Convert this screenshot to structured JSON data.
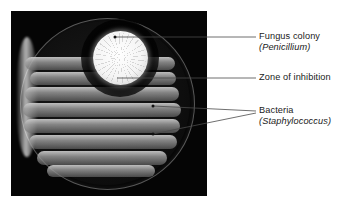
{
  "figure": {
    "kind": "labeled-photograph",
    "photo": {
      "background_color": "#050505",
      "dish_description": "circular petri dish with bacterial lawn streaks and a white fungal colony"
    },
    "colors": {
      "page_background": "#ffffff",
      "photo_background": "#050505",
      "text": "#1a1a1a",
      "leader_line": "#4a4a4a",
      "colony": "#ffffff",
      "streak": "#cdcdcd"
    }
  },
  "labels": [
    {
      "id": "fungus-colony",
      "name": "Fungus colony",
      "scientific": "(Penicillium)"
    },
    {
      "id": "zone-of-inhibition",
      "name": "Zone of inhibition",
      "scientific": ""
    },
    {
      "id": "bacteria",
      "name": "Bacteria",
      "scientific": "(Staphylococcus)"
    }
  ]
}
